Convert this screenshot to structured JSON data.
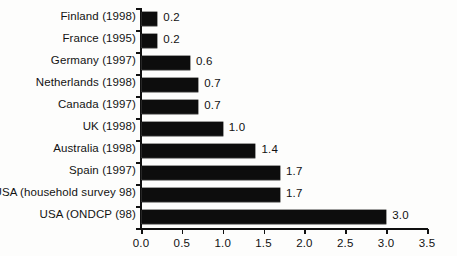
{
  "chart_data": {
    "type": "bar",
    "orientation": "horizontal",
    "title": "",
    "subtitle": "",
    "xlabel": "",
    "ylabel": "",
    "categories": [
      "Finland (1998)",
      "France (1995)",
      "Germany (1997)",
      "Netherlands (1998)",
      "Canada (1997)",
      "UK (1998)",
      "Australia (1998)",
      "Spain (1997)",
      "USA (household survey 98)",
      "USA (ONDCP (98)"
    ],
    "values": [
      0.2,
      0.2,
      0.6,
      0.7,
      0.7,
      1.0,
      1.4,
      1.7,
      1.7,
      3.0
    ],
    "value_labels": [
      "0.2",
      "0.2",
      "0.6",
      "0.7",
      "0.7",
      "1.0",
      "1.4",
      "1.7",
      "1.7",
      "3.0"
    ],
    "xlim": [
      0.0,
      3.5
    ],
    "xticks": [
      0.0,
      0.5,
      1.0,
      1.5,
      2.0,
      2.5,
      3.0,
      3.5
    ],
    "xtick_labels": [
      "0.0",
      "0.5",
      "1.0",
      "1.5",
      "2.0",
      "2.5",
      "3.0",
      "3.5"
    ],
    "grid": false,
    "legend": null,
    "bar_color": "#0d0d0d",
    "axis_color": "#101010",
    "background_color": "#fdfdfc"
  }
}
